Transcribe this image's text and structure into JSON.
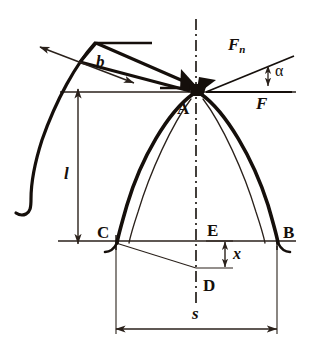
{
  "figure": {
    "kind": "technical-line-diagram",
    "background_color": "#ffffff",
    "ink_color": "#150f0b",
    "thin_ink_color": "#2a211b"
  },
  "labels": {
    "point_a": "A",
    "point_b": "B",
    "point_c": "C",
    "point_d": "D",
    "point_e": "E",
    "dim_b": "b",
    "dim_l": "l",
    "dim_s": "s",
    "dim_x": "x",
    "force_normal_base": "F",
    "force_normal_sub": "n",
    "force_f": "F",
    "angle_alpha": "α"
  },
  "geometry": {
    "centerline_x": 196,
    "baseline_y": 241,
    "apex_y": 92,
    "left_anchor_x": 116,
    "right_anchor_x": 277,
    "dim_s_y": 329,
    "dim_l_x": 78,
    "dim_x_top_y": 241,
    "dim_x_bottom_y": 268
  },
  "dimension_arrows": [
    {
      "name": "b",
      "style": "double-headed",
      "orientation": "diagonal"
    },
    {
      "name": "l",
      "style": "double-headed",
      "orientation": "vertical"
    },
    {
      "name": "s",
      "style": "double-headed",
      "orientation": "horizontal"
    },
    {
      "name": "x",
      "style": "double-headed",
      "orientation": "vertical"
    }
  ],
  "force_vectors": [
    {
      "name": "Fn",
      "style": "single-headed",
      "direction": "up-right"
    },
    {
      "name": "F",
      "style": "single-headed",
      "direction": "right-horizontal"
    }
  ]
}
